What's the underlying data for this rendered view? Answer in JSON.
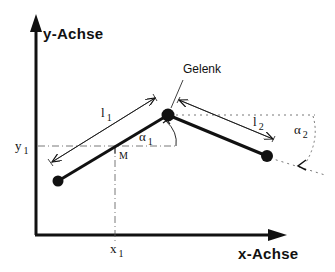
{
  "diagram": {
    "type": "two-link-arm-kinematics",
    "axes": {
      "y_label": "y-Achse",
      "x_label": "x-Achse"
    },
    "joint": {
      "label": "Gelenk"
    },
    "links": [
      {
        "name": "l",
        "sub": "1"
      },
      {
        "name": "l",
        "sub": "2"
      }
    ],
    "angles": [
      {
        "name": "α",
        "sub": "1"
      },
      {
        "name": "α",
        "sub": "2"
      }
    ],
    "midpoint": {
      "label": "M",
      "x_coord": {
        "name": "x",
        "sub": "1"
      },
      "y_coord": {
        "name": "y",
        "sub": "1"
      }
    },
    "colors": {
      "stroke": "#111111",
      "background": "#ffffff",
      "guide": "#555555"
    }
  }
}
